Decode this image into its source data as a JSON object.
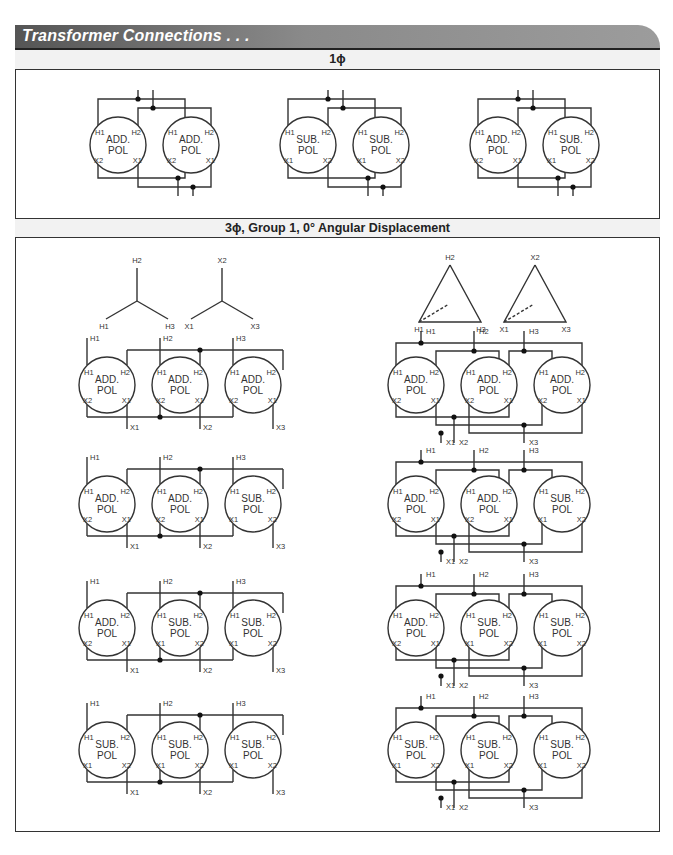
{
  "header": {
    "title": "Transformer Connections . . ."
  },
  "sections": [
    {
      "label": "1ϕ"
    },
    {
      "label": "3ϕ, Group 1, 0° Angular Displacement"
    }
  ],
  "single_phase": {
    "diagrams": [
      {
        "left": [
          "ADD.",
          "POL"
        ],
        "right": [
          "ADD.",
          "POL"
        ],
        "left_terms": [
          "H1",
          "H2",
          "X2",
          "X1"
        ],
        "right_terms": [
          "H1",
          "H2",
          "X2",
          "X1"
        ]
      },
      {
        "left": [
          "SUB.",
          "POL"
        ],
        "right": [
          "SUB.",
          "POL"
        ],
        "left_terms": [
          "H1",
          "H2",
          "X1",
          "X2"
        ],
        "right_terms": [
          "H1",
          "H2",
          "X1",
          "X2"
        ]
      },
      {
        "left": [
          "ADD.",
          "POL"
        ],
        "right": [
          "SUB.",
          "POL"
        ],
        "left_terms": [
          "H1",
          "H2",
          "X2",
          "X1"
        ],
        "right_terms": [
          "H1",
          "H2",
          "X1",
          "X2"
        ]
      }
    ]
  },
  "three_phase": {
    "wye_labels": {
      "h": [
        "H2",
        "H1",
        "H3"
      ],
      "x": [
        "X2",
        "X1",
        "X3"
      ]
    },
    "delta_labels": {
      "h": [
        "H2",
        "H1",
        "H3"
      ],
      "x": [
        "X2",
        "X1",
        "X3"
      ]
    },
    "rows": [
      {
        "units": [
          [
            "ADD.",
            "POL"
          ],
          [
            "ADD.",
            "POL"
          ],
          [
            "ADD.",
            "POL"
          ]
        ]
      },
      {
        "units": [
          [
            "ADD.",
            "POL"
          ],
          [
            "ADD.",
            "POL"
          ],
          [
            "SUB.",
            "POL"
          ]
        ]
      },
      {
        "units": [
          [
            "ADD.",
            "POL"
          ],
          [
            "SUB.",
            "POL"
          ],
          [
            "SUB.",
            "POL"
          ]
        ]
      },
      {
        "units": [
          [
            "SUB.",
            "POL"
          ],
          [
            "SUB.",
            "POL"
          ],
          [
            "SUB.",
            "POL"
          ]
        ]
      }
    ],
    "line_labels": {
      "h": [
        "H1",
        "H2",
        "H3"
      ],
      "x": [
        "X1",
        "X2",
        "X3"
      ]
    }
  },
  "caption": {
    "text": "Figure 4-17. Transformer connections"
  }
}
